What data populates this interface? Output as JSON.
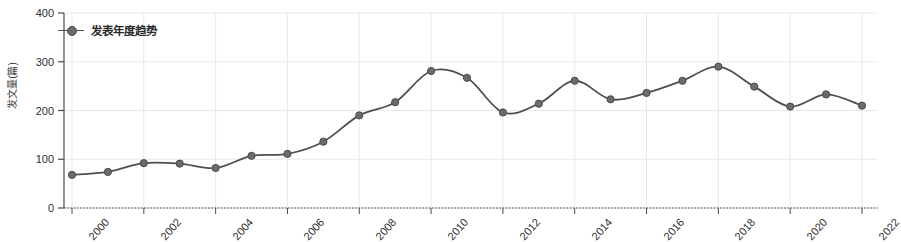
{
  "chart_data": {
    "type": "line",
    "title": "",
    "xlabel": "",
    "ylabel": "发文量(篇)",
    "legend_position": "top-left",
    "grid": true,
    "xlim": [
      1999.5,
      2022.5
    ],
    "ylim": [
      0,
      400
    ],
    "ytick_labels": [
      "0",
      "100",
      "200",
      "300",
      "400"
    ],
    "ytick_values": [
      0,
      100,
      200,
      300,
      400
    ],
    "xtick_labels": [
      "2000",
      "2002",
      "2004",
      "2006",
      "2008",
      "2010",
      "2012",
      "2014",
      "2016",
      "2018",
      "2020",
      "2022"
    ],
    "xtick_values": [
      2000,
      2002,
      2004,
      2006,
      2008,
      2010,
      2012,
      2014,
      2016,
      2018,
      2020,
      2022
    ],
    "categories": [
      2000,
      2001,
      2002,
      2003,
      2004,
      2005,
      2006,
      2007,
      2008,
      2009,
      2010,
      2011,
      2012,
      2013,
      2014,
      2015,
      2016,
      2017,
      2018,
      2019,
      2020,
      2021,
      2022
    ],
    "series": [
      {
        "name": "发表年度趋势",
        "color": "#4f4f4f",
        "marker_color": "#6b6b6b",
        "values": [
          68,
          74,
          92,
          91,
          82,
          107,
          111,
          136,
          190,
          217,
          281,
          267,
          196,
          214,
          261,
          223,
          236,
          261,
          290,
          249,
          208,
          233,
          210
        ]
      }
    ]
  },
  "legend": {
    "entries": [
      {
        "label": "发表年度趋势"
      }
    ]
  },
  "axes": {
    "y_label": "发文量(篇)"
  },
  "colors": {
    "line": "#4f4f4f",
    "marker": "#6b6b6b",
    "grid": "#e8e8e8",
    "axis": "#4a4a4a",
    "text": "#2e2e2e",
    "background": "#ffffff"
  }
}
